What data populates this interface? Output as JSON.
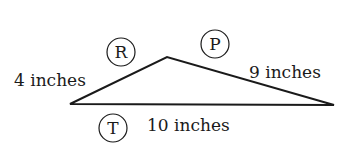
{
  "diagram": {
    "type": "triangle",
    "stroke_color": "#1a1a1a",
    "vertices": {
      "left": [
        70,
        104
      ],
      "apex": [
        167,
        57
      ],
      "right": [
        334,
        105
      ]
    },
    "angle_labels": [
      {
        "id": "R",
        "label": "R",
        "cx": 121,
        "cy": 52
      },
      {
        "id": "P",
        "label": "P",
        "cx": 215,
        "cy": 44
      },
      {
        "id": "T",
        "label": "T",
        "cx": 113,
        "cy": 128
      }
    ],
    "side_labels": [
      {
        "side": "left",
        "text": "4 inches",
        "x": 14,
        "y": 86
      },
      {
        "side": "right",
        "text": "9 inches",
        "x": 249,
        "y": 78
      },
      {
        "side": "bottom",
        "text": "10 inches",
        "x": 147,
        "y": 131
      }
    ]
  }
}
